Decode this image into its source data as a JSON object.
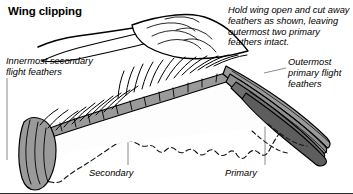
{
  "figure": {
    "title": "Wing clipping",
    "type": "anatomical-diagram",
    "background_color": "#ffffff",
    "ink_color": "#000000",
    "feather_fill_light": "#ffffff",
    "feather_fill_mid": "#9a9a9a",
    "feather_fill_dark": "#6f6f6f",
    "leader_line_color": "#8c8c8c"
  },
  "captions": {
    "instruction": "Hold wing open and cut away feathers as shown, leaving outermost two primary feathers intact."
  },
  "labels": {
    "innermost_secondary": "Innermost secondary\nflight feathers",
    "outermost_primary": "Outermost\nprimary flight\nfeathers",
    "secondary": "Secondary",
    "primary": "Primary"
  }
}
